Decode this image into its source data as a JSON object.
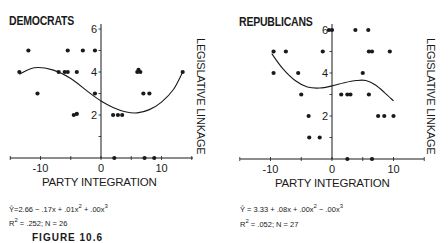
{
  "figure": {
    "caption_partial": "FIGURE 10.6"
  },
  "chart_data": [
    {
      "type": "scatter",
      "title": "DEMOCRATS",
      "xlabel": "PARTY INTEGRATION",
      "ylabel": "LEGISLATIVE LINKAGE",
      "xlim": [
        -15,
        15
      ],
      "ylim": [
        0,
        6.5
      ],
      "x_ticks": [
        -10,
        0,
        10
      ],
      "x_minor_ticks": [
        -15,
        -10,
        -5,
        0,
        5,
        10,
        15
      ],
      "y_ticks": [
        2,
        4,
        6
      ],
      "y_minor_ticks": [
        1,
        2,
        3,
        4,
        5,
        6
      ],
      "grid": false,
      "points": [
        [
          -12,
          5
        ],
        [
          -5.5,
          5
        ],
        [
          -3,
          5
        ],
        [
          -1,
          5
        ],
        [
          -13.5,
          4
        ],
        [
          -7,
          4
        ],
        [
          -6,
          4
        ],
        [
          -5.5,
          4
        ],
        [
          -4,
          4
        ],
        [
          6,
          4
        ],
        [
          6.2,
          4.1
        ],
        [
          6.5,
          4
        ],
        [
          13.5,
          4
        ],
        [
          -10.5,
          3
        ],
        [
          -1,
          3
        ],
        [
          7,
          3
        ],
        [
          8,
          3
        ],
        [
          -4.5,
          2
        ],
        [
          -4,
          2.05
        ],
        [
          2,
          2
        ],
        [
          2.8,
          2
        ],
        [
          3.5,
          2
        ],
        [
          2.2,
          0
        ],
        [
          7.2,
          0
        ],
        [
          8.8,
          0
        ]
      ],
      "fit": {
        "label": "cubic regression",
        "equation": "Ŷ=2.66 − .17x + .01x² + .00x³",
        "eq_parts": {
          "yhat": "Ŷ",
          "text1": "=2.66 − .17x + .01x",
          "sup1": "2",
          "text2": " + .00x",
          "sup2": "3"
        },
        "stats": {
          "r2_label": "R",
          "r2_sup": "2",
          "r2_text": " = .252;  N = 26"
        },
        "r2": 0.252,
        "n": 26,
        "curve": [
          [
            -13.5,
            3.9
          ],
          [
            -11,
            4.2
          ],
          [
            -8,
            4.1
          ],
          [
            -5,
            3.7
          ],
          [
            -2,
            3.05
          ],
          [
            0,
            2.65
          ],
          [
            2,
            2.35
          ],
          [
            4,
            2.15
          ],
          [
            6,
            2.1
          ],
          [
            8,
            2.25
          ],
          [
            10,
            2.6
          ],
          [
            12,
            3.2
          ],
          [
            13.5,
            4.0
          ]
        ]
      },
      "tick_labels": {
        "x": [
          "-10",
          "0",
          "10"
        ],
        "y": [
          "2",
          "4",
          "6"
        ]
      }
    },
    {
      "type": "scatter",
      "title": "REPUBLICANS",
      "xlabel": "PARTY INTEGRATION",
      "ylabel": "LEGISLATIVE LINKAGE",
      "xlim": [
        -15,
        15
      ],
      "ylim": [
        0,
        6.5
      ],
      "x_ticks": [
        -10,
        0,
        10
      ],
      "x_minor_ticks": [
        -15,
        -10,
        -5,
        0,
        5,
        10,
        15
      ],
      "y_ticks": [
        2,
        4,
        6
      ],
      "y_minor_ticks": [
        1,
        2,
        3,
        4,
        5,
        6
      ],
      "grid": false,
      "points": [
        [
          -0.5,
          6
        ],
        [
          0,
          6
        ],
        [
          3.8,
          6
        ],
        [
          5.9,
          6
        ],
        [
          -9.5,
          5
        ],
        [
          -7.5,
          5
        ],
        [
          -1.5,
          5
        ],
        [
          6,
          5
        ],
        [
          6.5,
          5
        ],
        [
          9.4,
          5
        ],
        [
          -9.5,
          4
        ],
        [
          -5.5,
          4
        ],
        [
          5,
          4
        ],
        [
          -5,
          3
        ],
        [
          1.5,
          3
        ],
        [
          2.5,
          3
        ],
        [
          3,
          3
        ],
        [
          6,
          3
        ],
        [
          -3.8,
          2
        ],
        [
          7.5,
          2
        ],
        [
          8.5,
          2
        ],
        [
          10,
          2
        ],
        [
          -3.7,
          1
        ],
        [
          -2,
          1
        ],
        [
          2.5,
          0
        ],
        [
          6.5,
          0
        ]
      ],
      "fit": {
        "label": "cubic regression",
        "equation": "Ŷ = 3.33 + .08x + .00x² − .00x³",
        "eq_parts": {
          "yhat": "Ŷ",
          "text1": " = 3.33 + .08x + .00x",
          "sup1": "2",
          "text2": " − .00x",
          "sup2": "3"
        },
        "stats": {
          "r2_label": "R",
          "r2_sup": "2",
          "r2_text": " = .052;  N = 27"
        },
        "r2": 0.052,
        "n": 27,
        "curve": [
          [
            -9.8,
            4.9
          ],
          [
            -8,
            4.2
          ],
          [
            -6,
            3.65
          ],
          [
            -4,
            3.35
          ],
          [
            -2,
            3.3
          ],
          [
            0,
            3.4
          ],
          [
            2,
            3.55
          ],
          [
            4,
            3.65
          ],
          [
            5.5,
            3.65
          ],
          [
            7,
            3.45
          ],
          [
            8.5,
            3.1
          ],
          [
            10,
            2.7
          ]
        ]
      },
      "tick_labels": {
        "x": [
          "-10",
          "0",
          "10"
        ],
        "y": [
          "2",
          "4",
          "6"
        ]
      }
    }
  ]
}
